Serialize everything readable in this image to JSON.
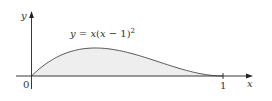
{
  "chart_data": {
    "type": "area",
    "title": "",
    "function_label": "y = x(x − 1)²",
    "function_label_parts": {
      "lhs": "y",
      "eq": " = ",
      "rhs_a": "x",
      "rhs_b": "(",
      "rhs_c": "x",
      "rhs_d": " − 1)",
      "exp": "2"
    },
    "xlabel": "x",
    "ylabel": "y",
    "x_ticks": [
      {
        "value": 0,
        "label": "0"
      },
      {
        "value": 1,
        "label": "1"
      }
    ],
    "xlim": [
      0,
      1.15
    ],
    "ylim": [
      0,
      0.28
    ],
    "grid": false,
    "shaded_region": {
      "from": 0,
      "to": 1,
      "under": "curve",
      "fill": "#eeeeee"
    },
    "x": [
      0,
      0.05,
      0.1,
      0.15,
      0.2,
      0.25,
      0.3,
      0.333,
      0.4,
      0.45,
      0.5,
      0.55,
      0.6,
      0.65,
      0.7,
      0.75,
      0.8,
      0.85,
      0.9,
      0.95,
      1.0
    ],
    "values": [
      0,
      0.045,
      0.081,
      0.108,
      0.128,
      0.141,
      0.147,
      0.148,
      0.144,
      0.136,
      0.125,
      0.111,
      0.096,
      0.08,
      0.063,
      0.047,
      0.032,
      0.019,
      0.009,
      0.002,
      0
    ],
    "colors": {
      "curve": "#555555",
      "axis": "#222222",
      "fill": "#eeeeee"
    }
  },
  "labels": {
    "origin": "0",
    "one": "1",
    "x_axis": "x",
    "y_axis": "y"
  }
}
